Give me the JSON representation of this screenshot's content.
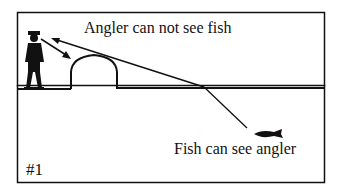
{
  "diagram": {
    "labels": {
      "top": "Angler can not see fish",
      "bottom": "Fish can see angler",
      "number": "#1"
    },
    "colors": {
      "ink": "#111111",
      "background": "#ffffff"
    },
    "elements": [
      "angler-silhouette",
      "bank-mound",
      "water-surface",
      "sight-line",
      "refracted-line",
      "fish-silhouette",
      "arrow-angler-to-mound",
      "arrow-mound-to-angler"
    ]
  }
}
